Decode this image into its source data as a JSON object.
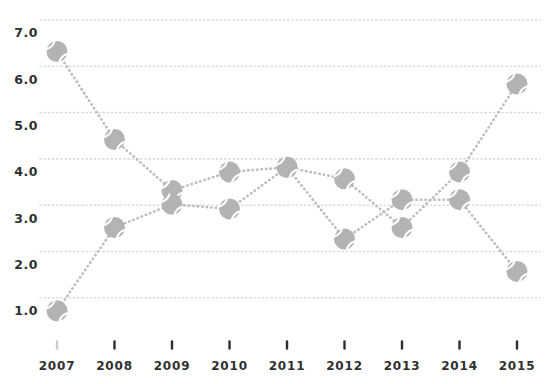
{
  "chart_data": {
    "type": "line",
    "title": "",
    "x_categories": [
      "2007",
      "2008",
      "2009",
      "2010",
      "2011",
      "2012",
      "2013",
      "2014",
      "2015"
    ],
    "series": [
      {
        "name": "series-1",
        "values": [
          6.6,
          4.7,
          3.6,
          4.0,
          4.1,
          3.85,
          2.8,
          4.0,
          5.9
        ]
      },
      {
        "name": "series-2",
        "values": [
          1.0,
          2.8,
          3.3,
          3.2,
          4.1,
          2.55,
          3.4,
          3.4,
          1.85
        ]
      }
    ],
    "y_ticks": [
      "7.0",
      "6.0",
      "5.0",
      "4.0",
      "3.0",
      "2.0",
      "1.0"
    ],
    "ylim": [
      1.0,
      7.0
    ],
    "xlabel": "",
    "ylabel": "",
    "grid": "horizontal-dotted",
    "legend": "none",
    "marker": "tennis-ball-icon",
    "line_style": "dotted",
    "faint_first_x_tick": true,
    "colors": {
      "ball": "#b3b3b3",
      "ball_seam": "#ffffff",
      "line": "#bdbdbd",
      "grid": "#d9d9d9",
      "text": "#2f2f2f",
      "tick": "#2f2f2f",
      "background": "#ffffff"
    }
  }
}
